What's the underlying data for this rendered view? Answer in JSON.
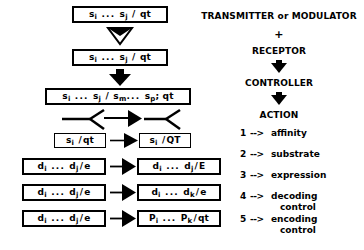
{
  "diagram": {
    "title_hidden": "",
    "flow_nodes": [
      {
        "id": "n1",
        "text": "s_i ... s_j / qt",
        "parts": [
          "s",
          "i",
          " ... ",
          "s",
          "j",
          " / qt"
        ]
      },
      {
        "id": "n2",
        "text": "s_i ... s_j / qt",
        "parts": [
          "s",
          "i",
          " ... ",
          "s",
          "j",
          " / qt"
        ]
      },
      {
        "id": "n3",
        "text": "s_i ... s_j / s_m ... s_p ; qt",
        "parts": [
          "s",
          "i",
          " ... ",
          "s",
          "j",
          " / ",
          "s",
          "m",
          " ... ",
          "s",
          "p",
          "; qt"
        ]
      },
      {
        "id": "n4",
        "text": "s_i /qt"
      },
      {
        "id": "n5",
        "text": "s_i /QT"
      },
      {
        "id": "n6",
        "text": "d_i ... d_j /e"
      },
      {
        "id": "n7",
        "text": "d_i ... d_j /E"
      },
      {
        "id": "n8",
        "text": "d_i ... d_j /e"
      },
      {
        "id": "n9",
        "text": "d_i ... d_k /e"
      },
      {
        "id": "n10",
        "text": "d_i ... d_j /e"
      },
      {
        "id": "n11",
        "text": "P_i ... P_k /qt"
      }
    ],
    "right_column": {
      "line1": "TRANSMITTER or MODULATOR",
      "plus": "+",
      "line2": "RECEPTOR",
      "line3": "CONTROLLER",
      "line4": "ACTION",
      "items": [
        {
          "num": "1",
          "arrow": "-->",
          "label": "affinity",
          "cont": ""
        },
        {
          "num": "2",
          "arrow": "-->",
          "label": "substrate",
          "cont": ""
        },
        {
          "num": "3",
          "arrow": "-->",
          "label": "expression",
          "cont": ""
        },
        {
          "num": "4",
          "arrow": "-->",
          "label": "decoding",
          "cont": "control"
        },
        {
          "num": "5",
          "arrow": "-->",
          "label": "encoding",
          "cont": "control"
        }
      ]
    },
    "colors": {
      "ink": "#000000",
      "paper": "#ffffff"
    }
  }
}
